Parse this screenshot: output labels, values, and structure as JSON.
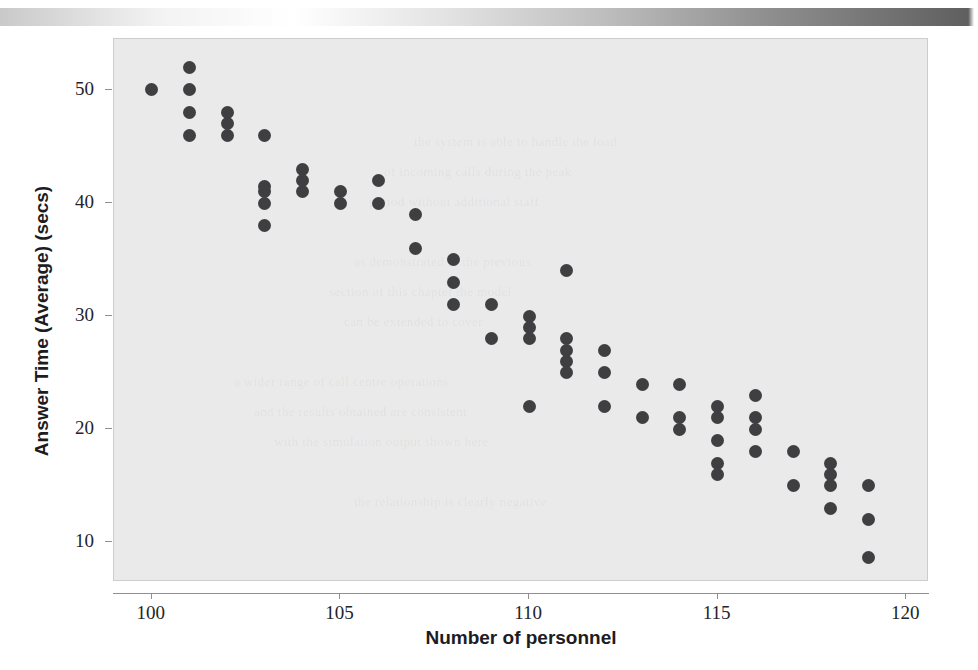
{
  "page": {
    "background_color": "#ffffff",
    "edge_bar": {
      "name": "scan-edge-gradient-bar",
      "from_color": "#c9c9c9",
      "to_color": "#5f5f5f"
    }
  },
  "chart_data": {
    "type": "scatter",
    "title": "",
    "xlabel": "Number of personnel",
    "ylabel": "Answer Time (Average) (secs)",
    "xlim": [
      99.0,
      120.6
    ],
    "ylim": [
      6.5,
      54.5
    ],
    "xticks": [
      100,
      105,
      110,
      115,
      120
    ],
    "xticklabels": [
      "100",
      "105",
      "110",
      "115",
      "120"
    ],
    "yticks": [
      10,
      20,
      30,
      40,
      50
    ],
    "yticklabels": [
      "10",
      "20",
      "30",
      "40",
      "50"
    ],
    "grid": false,
    "legend": null,
    "marker": {
      "shape": "circle",
      "color": "#3f3f42",
      "size_px": 13
    },
    "plot_background_color": "#eaeaea",
    "axis_color": "#8f8f8f",
    "points": [
      {
        "x": 100,
        "y": 50
      },
      {
        "x": 101,
        "y": 52
      },
      {
        "x": 101,
        "y": 50
      },
      {
        "x": 101,
        "y": 48
      },
      {
        "x": 101,
        "y": 46
      },
      {
        "x": 102,
        "y": 48
      },
      {
        "x": 102,
        "y": 47
      },
      {
        "x": 102,
        "y": 46
      },
      {
        "x": 103,
        "y": 46
      },
      {
        "x": 103,
        "y": 41
      },
      {
        "x": 103,
        "y": 41.5
      },
      {
        "x": 103,
        "y": 40
      },
      {
        "x": 103,
        "y": 38
      },
      {
        "x": 104,
        "y": 43
      },
      {
        "x": 104,
        "y": 42
      },
      {
        "x": 104,
        "y": 41
      },
      {
        "x": 105,
        "y": 41
      },
      {
        "x": 105,
        "y": 40
      },
      {
        "x": 106,
        "y": 42
      },
      {
        "x": 106,
        "y": 40
      },
      {
        "x": 107,
        "y": 39
      },
      {
        "x": 107,
        "y": 36
      },
      {
        "x": 108,
        "y": 35
      },
      {
        "x": 108,
        "y": 33
      },
      {
        "x": 108,
        "y": 31
      },
      {
        "x": 109,
        "y": 31
      },
      {
        "x": 109,
        "y": 28
      },
      {
        "x": 110,
        "y": 30
      },
      {
        "x": 110,
        "y": 29
      },
      {
        "x": 110,
        "y": 28
      },
      {
        "x": 110,
        "y": 22
      },
      {
        "x": 111,
        "y": 34
      },
      {
        "x": 111,
        "y": 28
      },
      {
        "x": 111,
        "y": 27
      },
      {
        "x": 111,
        "y": 26
      },
      {
        "x": 111,
        "y": 25
      },
      {
        "x": 112,
        "y": 27
      },
      {
        "x": 112,
        "y": 25
      },
      {
        "x": 112,
        "y": 22
      },
      {
        "x": 113,
        "y": 24
      },
      {
        "x": 113,
        "y": 21
      },
      {
        "x": 114,
        "y": 24
      },
      {
        "x": 114,
        "y": 21
      },
      {
        "x": 114,
        "y": 20
      },
      {
        "x": 115,
        "y": 22
      },
      {
        "x": 115,
        "y": 21
      },
      {
        "x": 115,
        "y": 19
      },
      {
        "x": 115,
        "y": 17
      },
      {
        "x": 115,
        "y": 16
      },
      {
        "x": 116,
        "y": 23
      },
      {
        "x": 116,
        "y": 21
      },
      {
        "x": 116,
        "y": 20
      },
      {
        "x": 116,
        "y": 18
      },
      {
        "x": 117,
        "y": 18
      },
      {
        "x": 117,
        "y": 15
      },
      {
        "x": 118,
        "y": 17
      },
      {
        "x": 118,
        "y": 16
      },
      {
        "x": 118,
        "y": 15
      },
      {
        "x": 118,
        "y": 13
      },
      {
        "x": 119,
        "y": 15
      },
      {
        "x": 119,
        "y": 12
      },
      {
        "x": 119,
        "y": 8.7
      }
    ]
  },
  "ghost_text": [
    {
      "text": "the system is able to handle the load",
      "x": 300,
      "y": 95
    },
    {
      "text": "of incoming calls during the peak",
      "x": 270,
      "y": 125
    },
    {
      "text": "period without additional staff",
      "x": 255,
      "y": 155
    },
    {
      "text": "as demonstrated in the previous",
      "x": 240,
      "y": 215
    },
    {
      "text": "section of this chapter the model",
      "x": 215,
      "y": 245
    },
    {
      "text": "can be extended to cover",
      "x": 230,
      "y": 275
    },
    {
      "text": "a wider range of call centre operations",
      "x": 120,
      "y": 335
    },
    {
      "text": "and the results obtained are consistent",
      "x": 140,
      "y": 365
    },
    {
      "text": "with the simulation output shown here",
      "x": 160,
      "y": 395
    },
    {
      "text": "the relationship is clearly negative",
      "x": 240,
      "y": 455
    }
  ]
}
